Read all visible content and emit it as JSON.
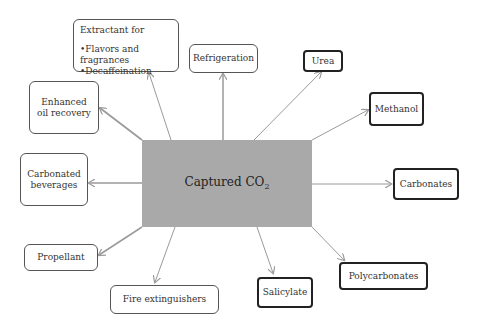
{
  "diagram": {
    "center": {
      "label": "Captured CO",
      "subscript": "2",
      "color": "#a9a9a9"
    },
    "nodes": {
      "extractant": {
        "title": "Extractant  for",
        "items": [
          "Flavors and fragrances",
          "Decaffeination"
        ]
      },
      "refrigeration": "Refrigeration",
      "urea": "Urea",
      "methanol": "Methanol",
      "enhanced_oil_recovery": [
        "Enhanced",
        "oil recovery"
      ],
      "carbonated_beverages": [
        "Carbonated",
        "beverages"
      ],
      "carbonates": "Carbonates",
      "propellant": "Propellant",
      "fire_extinguishers": "Fire extinguishers",
      "salicylate": "Salicylate",
      "polycarbonates": "Polycarbonates"
    },
    "arrow_color": "#9a9a9a"
  }
}
